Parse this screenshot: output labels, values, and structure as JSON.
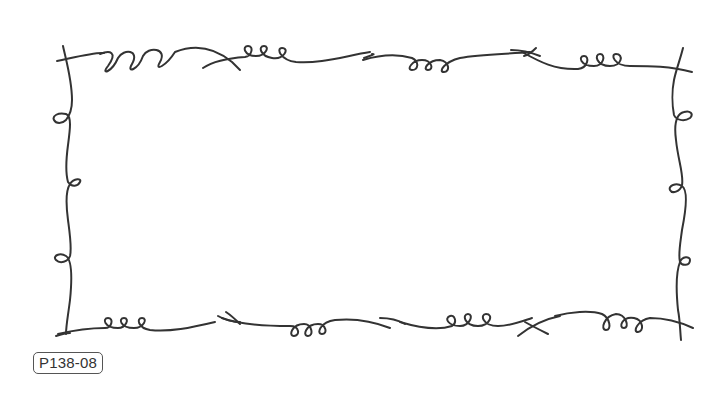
{
  "artwork": {
    "title": "Curly doodle rectangular frame",
    "stroke_color": "#333333",
    "background_color": "#ffffff",
    "edges": {
      "top": {
        "segments": 4,
        "loop_groups": [
          "3 loops",
          "3 loops",
          "3 loops",
          "3 loops"
        ]
      },
      "bottom": {
        "segments": 4,
        "loop_groups": [
          "3 loops",
          "3 loops",
          "3 loops",
          "3 loops"
        ]
      },
      "left": {
        "loops": 3
      },
      "right": {
        "loops": 3
      }
    }
  },
  "label": {
    "code": "P138-08"
  }
}
